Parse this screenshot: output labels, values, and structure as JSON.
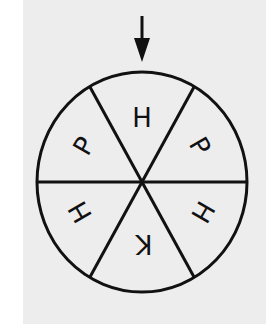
{
  "diagram": {
    "type": "spinner",
    "pointer": "down-arrow",
    "sections": [
      {
        "label": "H",
        "position": "top",
        "rotation": 0
      },
      {
        "label": "P",
        "position": "upper-right",
        "rotation": 60
      },
      {
        "label": "H",
        "position": "lower-right",
        "rotation": 120
      },
      {
        "label": "K",
        "position": "bottom",
        "rotation": 180
      },
      {
        "label": "H",
        "position": "lower-left",
        "rotation": 240
      },
      {
        "label": "P",
        "position": "upper-left",
        "rotation": 300
      }
    ],
    "colors": {
      "line": "#111111",
      "background": "#ededed"
    }
  }
}
